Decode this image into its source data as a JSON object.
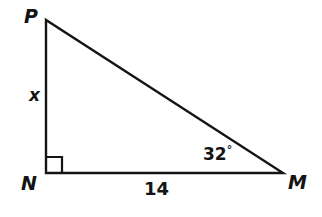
{
  "figure": {
    "kind": "right-triangle-diagram",
    "stroke_color": "#141414",
    "fill_color": "#ffffff",
    "background_color": "#ffffff",
    "stroke_width": 2.4,
    "vertices": [
      {
        "name": "P",
        "label": "P",
        "x": 46,
        "y": 20
      },
      {
        "name": "N",
        "label": "N",
        "x": 46,
        "y": 173
      },
      {
        "name": "M",
        "label": "M",
        "x": 283,
        "y": 173
      }
    ],
    "right_angle_marker": {
      "at_vertex": "N",
      "size": 16
    },
    "side_labels": [
      {
        "name": "side-PN",
        "text": "x",
        "italic": true
      },
      {
        "name": "side-NM",
        "text": "14",
        "italic": false
      }
    ],
    "angle_labels": [
      {
        "name": "angle-M",
        "value": "32",
        "degree_symbol": "°",
        "at_vertex": "M"
      }
    ]
  }
}
